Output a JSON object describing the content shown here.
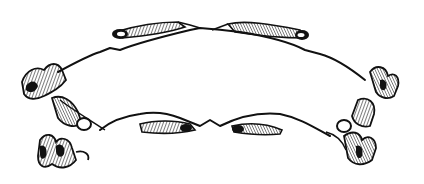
{
  "image": {
    "subject": "ornamental banner scroll",
    "style": "black ink engraving on white",
    "colors": {
      "ink": "#111111",
      "background": "#ffffff"
    },
    "text": ""
  }
}
